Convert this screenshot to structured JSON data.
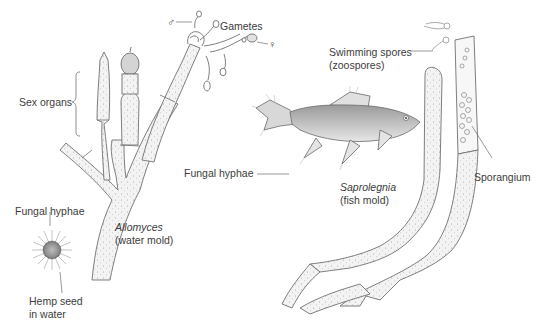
{
  "diagram": {
    "colors": {
      "line": "#6e6e6e",
      "fill": "#f1f1f1",
      "text": "#3c3c3c",
      "background": "#ffffff"
    },
    "labels": {
      "gametes": "Gametes",
      "male_symbol": "♂",
      "female_symbol": "♀",
      "sex_organs": "Sex organs",
      "fungal_hyphae_left": "Fungal hyphae",
      "hemp_seed_line1": "Hemp seed",
      "hemp_seed_line2": "in water",
      "allomyces_name": "Allomyces",
      "allomyces_common": "(water mold)",
      "swimming_spores_line1": "Swimming spores",
      "swimming_spores_line2": "(zoospores)",
      "fungal_hyphae_center": "Fungal hyphae",
      "sporangium": "Sporangium",
      "saprolegnia_name": "Saprolegnia",
      "saprolegnia_common": "(fish mold)"
    }
  }
}
